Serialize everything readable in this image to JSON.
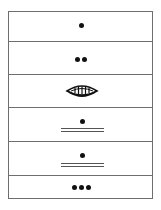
{
  "diagram": {
    "type": "stacked-symbol-column",
    "cells": [
      {
        "symbol": "single-dot",
        "dots": 1
      },
      {
        "symbol": "double-dot",
        "dots": 2
      },
      {
        "symbol": "striped-eye",
        "dots": 0
      },
      {
        "symbol": "dot-over-double-line",
        "dots": 1
      },
      {
        "symbol": "dot-over-double-line",
        "dots": 1
      },
      {
        "symbol": "triple-dot",
        "dots": 3
      }
    ]
  },
  "colors": {
    "border": "#6e6e6e",
    "ink": "#111111",
    "background": "#ffffff"
  }
}
